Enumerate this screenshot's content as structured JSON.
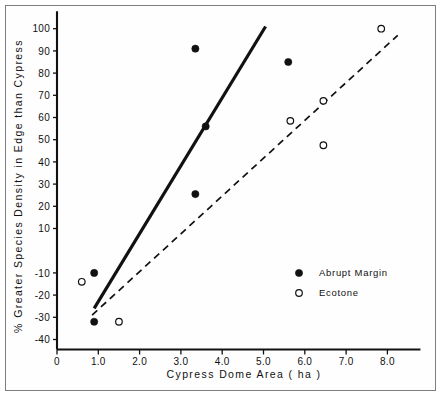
{
  "chart_data": {
    "type": "scatter",
    "title": "",
    "xlabel": "Cypress Dome Area  ( ha )",
    "ylabel": "% Greater Species Density in Edge than Cypress",
    "xlim": [
      0,
      8.8
    ],
    "ylim": [
      -47,
      107
    ],
    "grid": false,
    "legend_position": "inside-right",
    "xticks": [
      0,
      1.0,
      2.0,
      3.0,
      4.0,
      5.0,
      6.0,
      7.0,
      8.0
    ],
    "xtick_labels": [
      "0",
      "1.0",
      "2.0",
      "3.0",
      "4.0",
      "5.0",
      "6.0",
      "7.0",
      "8.0"
    ],
    "yticks": [
      100,
      90,
      80,
      70,
      60,
      50,
      40,
      30,
      20,
      10,
      -10,
      -20,
      -30,
      -40
    ],
    "ytick_labels": [
      "100",
      "90",
      "80",
      "70",
      "60",
      "50",
      "40",
      "30",
      "20",
      "10",
      "-10",
      "-20",
      "-30",
      "-40"
    ],
    "series": [
      {
        "name": "Abrupt Margin",
        "marker": "filled-circle",
        "points": [
          {
            "x": 0.9,
            "y": -10
          },
          {
            "x": 0.9,
            "y": -32
          },
          {
            "x": 3.35,
            "y": 91
          },
          {
            "x": 3.35,
            "y": 25.5
          },
          {
            "x": 3.6,
            "y": 56
          },
          {
            "x": 5.6,
            "y": 85
          }
        ],
        "fit_line": {
          "style": "solid",
          "x0": 0.9,
          "y0": -26,
          "x1": 5.05,
          "y1": 101
        }
      },
      {
        "name": "Ecotone",
        "marker": "open-circle",
        "points": [
          {
            "x": 0.6,
            "y": -14
          },
          {
            "x": 1.5,
            "y": -32
          },
          {
            "x": 5.65,
            "y": 58.5
          },
          {
            "x": 6.45,
            "y": 67.5
          },
          {
            "x": 6.45,
            "y": 47.5
          },
          {
            "x": 7.85,
            "y": 100
          }
        ],
        "fit_line": {
          "style": "dashed",
          "x0": 0.85,
          "y0": -29,
          "x1": 8.25,
          "y1": 97
        }
      }
    ]
  },
  "legend": {
    "entries": [
      {
        "label": "Abrupt Margin",
        "marker": "filled-circle"
      },
      {
        "label": "Ecotone",
        "marker": "open-circle"
      }
    ]
  },
  "axes": {
    "x_title": "Cypress Dome Area  ( ha )",
    "y_title": "% Greater Species Density in Edge than Cypress"
  }
}
